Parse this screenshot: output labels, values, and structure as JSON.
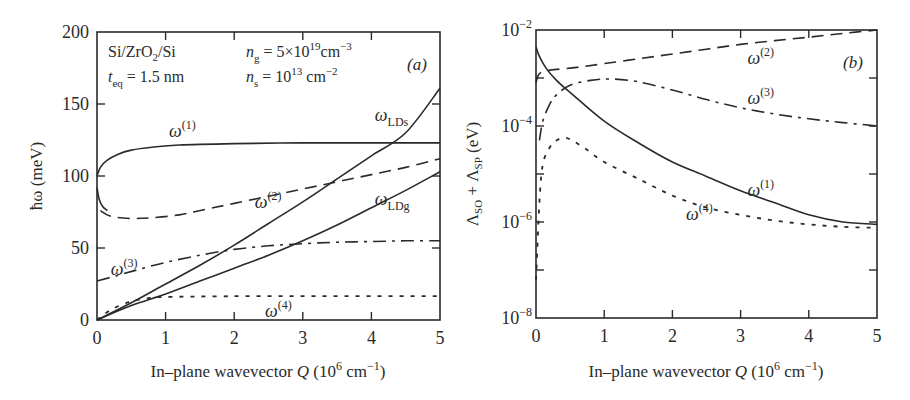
{
  "chart_data": [
    {
      "panel": "(a)",
      "type": "line",
      "title": "",
      "xlabel": "In–plane wavevector Q (10^6 cm^-1)",
      "ylabel": "ħω (meV)",
      "xlim": [
        0,
        5
      ],
      "ylim": [
        0,
        200
      ],
      "xticks": [
        0,
        1,
        2,
        3,
        4,
        5
      ],
      "yticks": [
        0,
        50,
        100,
        150,
        200
      ],
      "grid": false,
      "annotations": {
        "material": "Si/ZrO2/Si",
        "teq": "t_eq = 1.5 nm",
        "ng": "n_g = 5×10^19 cm^-3",
        "ns": "n_s = 10^13 cm^-2",
        "panel_label": "(a)"
      },
      "series": [
        {
          "name": "ω(1)",
          "style": "solid",
          "x": [
            0,
            0.05,
            0.15,
            0.3,
            0.5,
            0.8,
            1.2,
            2,
            3,
            4,
            5
          ],
          "y": [
            100,
            106,
            111,
            115,
            118,
            120,
            121.5,
            122.5,
            123,
            123,
            123
          ]
        },
        {
          "name": "ω(1) lower branch",
          "style": "solid",
          "x": [
            0,
            0.03,
            0.08,
            0.15
          ],
          "y": [
            92,
            84,
            79,
            76
          ]
        },
        {
          "name": "ω(2)",
          "style": "dashed",
          "x": [
            0.05,
            0.2,
            0.5,
            0.8,
            1.2,
            1.6,
            2,
            2.5,
            3,
            3.5,
            4,
            4.5,
            5
          ],
          "y": [
            76,
            72,
            70.5,
            71,
            73,
            77,
            81,
            86,
            91,
            96,
            101,
            106,
            112
          ]
        },
        {
          "name": "ω(3)",
          "style": "dashdot",
          "x": [
            0,
            0.3,
            0.6,
            1,
            1.5,
            2,
            2.5,
            3,
            3.5,
            4,
            4.5,
            5
          ],
          "y": [
            27,
            31,
            35,
            40,
            45,
            49,
            51.5,
            53,
            54,
            54.5,
            55,
            55
          ]
        },
        {
          "name": "ω(4)",
          "style": "dotted",
          "x": [
            0,
            0.2,
            0.5,
            0.8,
            1,
            2,
            3,
            4,
            5
          ],
          "y": [
            0,
            7,
            13,
            15.5,
            16,
            16.5,
            16.5,
            16.5,
            16.5
          ]
        },
        {
          "name": "ω_LDs",
          "style": "solid",
          "x": [
            0,
            0.5,
            1,
            1.5,
            2,
            2.5,
            3,
            3.5,
            4,
            4.5,
            5
          ],
          "y": [
            0,
            12,
            25,
            38,
            52,
            67,
            82,
            98,
            114,
            130,
            161
          ]
        },
        {
          "name": "ω_LDg",
          "style": "solid",
          "x": [
            0,
            0.5,
            1,
            1.5,
            2,
            2.5,
            3,
            3.5,
            4,
            4.5,
            5
          ],
          "y": [
            0,
            10,
            18,
            27,
            36,
            45,
            55,
            66,
            78,
            90,
            103
          ]
        }
      ],
      "labels": [
        {
          "text": "ω",
          "sup": "(1)",
          "x": 1.05,
          "y": 127
        },
        {
          "text": "ω",
          "sup": "(2)",
          "x": 2.3,
          "y": 78
        },
        {
          "text": "ω",
          "sup": "(3)",
          "x": 0.2,
          "y": 31
        },
        {
          "text": "ω",
          "sup": "(4)",
          "x": 2.45,
          "y": 2
        },
        {
          "text": "ω",
          "sub": "LDs",
          "x": 4.05,
          "y": 138
        },
        {
          "text": "ω",
          "sub": "LDg",
          "x": 4.05,
          "y": 80
        }
      ]
    },
    {
      "panel": "(b)",
      "type": "line",
      "title": "",
      "xlabel": "In–plane wavevector Q (10^6 cm^-1)",
      "ylabel": "Λ_SO + Λ_SP (eV)",
      "xlim": [
        0,
        5
      ],
      "ylim": [
        1e-08,
        0.01
      ],
      "yscale": "log",
      "xticks": [
        0,
        1,
        2,
        3,
        4,
        5
      ],
      "yticks": [
        "10^-8",
        "10^-6",
        "10^-4",
        "10^-2"
      ],
      "grid": false,
      "annotations": {
        "panel_label": "(b)"
      },
      "series": [
        {
          "name": "ω(1)",
          "style": "solid",
          "x": [
            0,
            0.05,
            0.15,
            0.3,
            0.5,
            1,
            1.5,
            2,
            2.5,
            3,
            3.5,
            4,
            4.5,
            5
          ],
          "log10y": [
            -2.35,
            -2.55,
            -2.8,
            -3.05,
            -3.3,
            -3.9,
            -4.35,
            -4.75,
            -5.05,
            -5.35,
            -5.6,
            -5.85,
            -6.0,
            -6.05
          ]
        },
        {
          "name": "ω(2)",
          "style": "dashed",
          "x": [
            0,
            0.03,
            0.08,
            0.15,
            0.3,
            0.6,
            1,
            1.5,
            2,
            2.5,
            3,
            3.5,
            4,
            4.5,
            5
          ],
          "log10y": [
            -3.1,
            -2.95,
            -2.88,
            -2.85,
            -2.82,
            -2.78,
            -2.7,
            -2.6,
            -2.5,
            -2.4,
            -2.3,
            -2.22,
            -2.15,
            -2.07,
            -2.0
          ]
        },
        {
          "name": "ω(3)",
          "style": "dashdot",
          "x": [
            0.05,
            0.1,
            0.2,
            0.3,
            0.5,
            0.8,
            1.1,
            1.5,
            2,
            2.5,
            3,
            3.5,
            4,
            4.5,
            5
          ],
          "log10y": [
            -4.3,
            -3.9,
            -3.55,
            -3.35,
            -3.15,
            -3.05,
            -3.02,
            -3.08,
            -3.25,
            -3.45,
            -3.62,
            -3.75,
            -3.85,
            -3.93,
            -4.0
          ]
        },
        {
          "name": "ω(4)",
          "style": "dotted",
          "x": [
            0,
            0.05,
            0.1,
            0.2,
            0.3,
            0.45,
            0.7,
            1,
            1.5,
            2,
            2.5,
            3,
            3.5,
            4,
            4.5,
            5
          ],
          "log10y": [
            -7.2,
            -5.6,
            -4.8,
            -4.45,
            -4.3,
            -4.25,
            -4.45,
            -4.75,
            -5.1,
            -5.45,
            -5.7,
            -5.85,
            -5.97,
            -6.05,
            -6.1,
            -6.12
          ]
        }
      ],
      "labels": [
        {
          "text": "ω",
          "sup": "(2)",
          "x": 3.1,
          "y": -2.7
        },
        {
          "text": "ω",
          "sup": "(3)",
          "x": 3.1,
          "y": -3.55
        },
        {
          "text": "ω",
          "sup": "(1)",
          "x": 3.1,
          "y": -5.45
        },
        {
          "text": "ω",
          "sup": "(4)",
          "x": 2.2,
          "y": -5.95
        }
      ]
    }
  ],
  "panel_a": {
    "y_axis_label": "ħω (meV)",
    "x_axis_label_pre": "In–plane wavevector ",
    "x_axis_label_q": "Q",
    "x_axis_label_post": " (10",
    "x_axis_label_exp": "6",
    "x_axis_label_unit": " cm",
    "x_axis_label_unit_exp": "−1",
    "x_axis_label_close": ")",
    "x_ticks": [
      "0",
      "1",
      "2",
      "3",
      "4",
      "5"
    ],
    "y_ticks": [
      "0",
      "50",
      "100",
      "150",
      "200"
    ],
    "material_si1": "Si/ZrO",
    "material_sub": "2",
    "material_si2": "/Si",
    "teq_t": "t",
    "teq_sub": "eq",
    "teq_val": " = 1.5 nm",
    "ng_n": "n",
    "ng_sub": "g",
    "ng_val": " = 5×10",
    "ng_exp": "19",
    "ng_unit": "cm",
    "ng_unit_exp": "−3",
    "ns_n": "n",
    "ns_sub": "s",
    "ns_val": " = 10",
    "ns_exp": "13",
    "ns_unit": " cm",
    "ns_unit_exp": "−2",
    "panel_label": "(a)"
  },
  "panel_b": {
    "y_axis_label_l1": "Λ",
    "y_axis_sub1": "SO",
    "y_axis_plus": " + Λ",
    "y_axis_sub2": "SP",
    "y_axis_unit": " (eV)",
    "x_ticks": [
      "0",
      "1",
      "2",
      "3",
      "4",
      "5"
    ],
    "y_tick_base": "10",
    "y_tick_exps": [
      "−8",
      "−6",
      "−4",
      "−2"
    ],
    "panel_label": "(b)"
  }
}
